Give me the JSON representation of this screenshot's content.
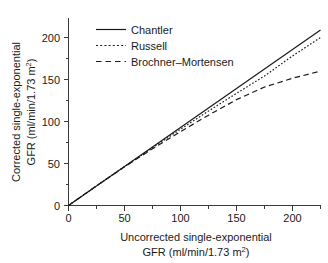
{
  "chart_data": {
    "type": "line",
    "title": "",
    "subtitle": "",
    "xlabel_line1": "Uncorrected single-exponential",
    "xlabel_line2": "GFR (ml/min/1.73 m",
    "xlabel_line2_sup": "2",
    "xlabel_line2_end": ")",
    "ylabel_line1": "Corrected single-exponential",
    "ylabel_line2": "GFR (ml/min/1.73 m",
    "ylabel_line2_sup": "2",
    "ylabel_line2_end": ")",
    "xlim": [
      0,
      225
    ],
    "ylim": [
      0,
      215
    ],
    "xticks": [
      0,
      50,
      100,
      150,
      200
    ],
    "yticks": [
      0,
      50,
      100,
      150,
      200
    ],
    "xtick_labels": [
      "0",
      "50",
      "100",
      "150",
      "200"
    ],
    "ytick_labels": [
      "0",
      "50",
      "100",
      "150",
      "200"
    ],
    "xminor_ticks": [
      25,
      75,
      125,
      175,
      225
    ],
    "yminor_ticks": [
      25,
      75,
      125,
      175
    ],
    "grid": false,
    "legend_position": "top-left",
    "x": [
      0,
      25,
      50,
      75,
      100,
      125,
      150,
      175,
      200,
      225
    ],
    "series": [
      {
        "name": "Chantler",
        "style": "solid",
        "values": [
          0,
          23.2,
          46.4,
          69.6,
          92.8,
          116.0,
          139.2,
          162.4,
          185.6,
          208.8
        ]
      },
      {
        "name": "Russell",
        "style": "dotted",
        "values": [
          0,
          23.4,
          46.3,
          68.8,
          90.8,
          112.4,
          133.5,
          154.2,
          178.0,
          200.0
        ]
      },
      {
        "name": "Brochner-Mortensen",
        "style": "dashed",
        "values": [
          0,
          23.5,
          46.0,
          67.5,
          88.0,
          107.5,
          126.0,
          141.0,
          151.5,
          160.0
        ]
      }
    ],
    "legend_entries": [
      {
        "label": "Chantler",
        "style": "solid"
      },
      {
        "label": "Russell",
        "style": "dotted"
      },
      {
        "label": "Brochner–Mortensen",
        "style": "dashed"
      }
    ]
  }
}
